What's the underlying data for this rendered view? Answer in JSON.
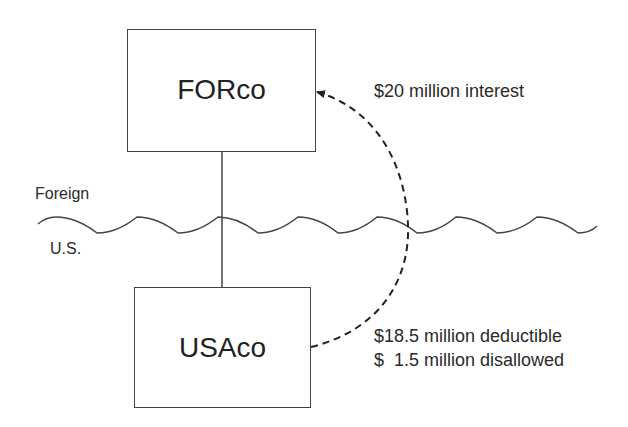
{
  "diagram": {
    "entities": {
      "foreign_parent": {
        "label": "FORco"
      },
      "us_subsidiary": {
        "label": "USAco"
      }
    },
    "border": {
      "upper_label": "Foreign",
      "lower_label": "U.S."
    },
    "flows": {
      "interest": {
        "label": "$20 million interest"
      },
      "deductible": {
        "label": "$18.5 million deductible"
      },
      "disallowed": {
        "label": "$  1.5 million disallowed"
      }
    },
    "colors": {
      "stroke": "#444444",
      "text": "#2a2a2a",
      "background": "#ffffff"
    }
  }
}
